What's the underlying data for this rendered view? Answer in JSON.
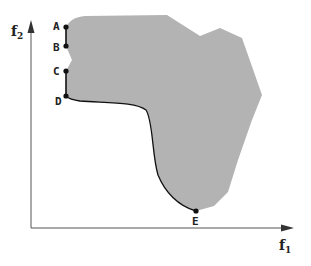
{
  "diagram": {
    "type": "objective-space / pareto front illustration",
    "axes": {
      "x_label": "f",
      "x_subscript": "1",
      "y_label": "f",
      "y_subscript": "2"
    },
    "region": {
      "description": "feasible objective region",
      "fill_color": "#b3b3b3"
    },
    "points": [
      {
        "label": "A",
        "x": 66,
        "y": 27
      },
      {
        "label": "B",
        "x": 66,
        "y": 46
      },
      {
        "label": "C",
        "x": 66,
        "y": 71
      },
      {
        "label": "D",
        "x": 66,
        "y": 96
      },
      {
        "label": "E",
        "x": 196,
        "y": 211
      }
    ],
    "front_segments": [
      "A-B",
      "C-D",
      "D-E (curve)"
    ],
    "colors": {
      "axis": "#555555",
      "front": "#111111",
      "region": "#b3b3b3"
    }
  }
}
